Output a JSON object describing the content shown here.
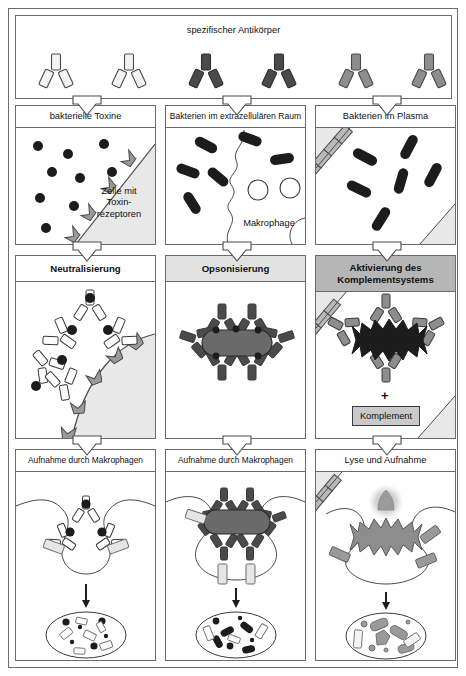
{
  "diagram": {
    "top_banner": {
      "label": "spezifischer Antikörper",
      "antibody_groups": [
        {
          "column": 1,
          "fill": "#f2f2f2",
          "count": 2
        },
        {
          "column": 2,
          "fill": "#4a4a4a",
          "count": 2
        },
        {
          "column": 3,
          "fill": "#8d8d8d",
          "count": 2
        }
      ]
    },
    "columns": [
      {
        "id": "neutralisierung",
        "row1_label": "bakterielle Toxine",
        "row1_inline_labels": [
          "Zelle mit",
          "Toxin-",
          "rezeptoren"
        ],
        "row2_label": "Neutralisierung",
        "row2_header_shade": "#ffffff",
        "row3_label": "Aufnahme durch Makrophagen",
        "antigen_type": "toxin-dots",
        "antibody_fill": "#f2f2f2"
      },
      {
        "id": "opsonisierung",
        "row1_label": "Bakterien im extrazellulären Raum",
        "row1_inline_labels": [
          "Makrophage"
        ],
        "row2_label": "Opsonisierung",
        "row2_header_shade": "#e2e2e2",
        "row3_label": "Aufnahme durch Makrophagen",
        "antigen_type": "bacteria-rods",
        "antibody_fill": "#4a4a4a"
      },
      {
        "id": "komplement",
        "row1_label": "Bakterien im Plasma",
        "row1_inline_labels": [],
        "row2_label_line1": "Aktivierung des",
        "row2_label_line2": "Komplementsystems",
        "row2_header_shade": "#b6b6b6",
        "row2_extra_box": "Komplement",
        "row2_plus_sign": "+",
        "row3_label": "Lyse und Aufnahme",
        "antigen_type": "bacteria-rods",
        "antibody_fill": "#8d8d8d"
      }
    ],
    "colors": {
      "outline": "#6b6b6b",
      "dark_antigen": "#2b2b2b",
      "cell_fill": "#e8e8e8",
      "receptor_fill": "#9a9a9a",
      "vessel_fill": "#b9b9b9"
    }
  }
}
